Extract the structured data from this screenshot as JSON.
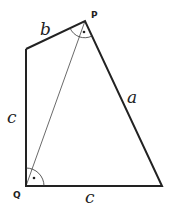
{
  "diagram": {
    "vertices": {
      "P": {
        "label": "P",
        "x": 85,
        "y": 21
      },
      "Q": {
        "label": "Q",
        "x": 26,
        "y": 186
      },
      "top_left": {
        "x": 26,
        "y": 49
      },
      "bottom_right": {
        "x": 162,
        "y": 186
      }
    },
    "edges": [
      {
        "from": "top_left",
        "to": "P",
        "label": "b"
      },
      {
        "from": "P",
        "to": "bottom_right",
        "label": "a"
      },
      {
        "from": "Q",
        "to": "bottom_right",
        "label": "c"
      },
      {
        "from": "top_left",
        "to": "Q",
        "label": "c"
      },
      {
        "from": "Q",
        "to": "P",
        "label": "",
        "style": "thin diagonal"
      }
    ],
    "labels": {
      "b": "b",
      "a": "a",
      "c_left": "c",
      "c_bottom": "c",
      "P": "P",
      "Q": "Q"
    },
    "angle_marks": [
      "P",
      "Q"
    ],
    "colors": {
      "stroke": "#222222",
      "background": "#ffffff"
    }
  }
}
